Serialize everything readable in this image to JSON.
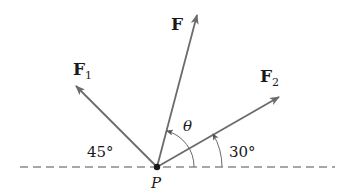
{
  "diagram": {
    "type": "force-vector-diagram",
    "point": {
      "label": "P"
    },
    "vectors": [
      {
        "name": "F1",
        "label": "F",
        "subscript": "1",
        "angle_from_horizontal": "45°",
        "side": "left"
      },
      {
        "name": "F",
        "label": "F",
        "subscript": "",
        "angle_label": "θ"
      },
      {
        "name": "F2",
        "label": "F",
        "subscript": "2",
        "angle_from_horizontal": "30°",
        "side": "right"
      }
    ],
    "angle_labels": {
      "f1_angle": "45°",
      "f2_angle": "30°",
      "theta": "θ"
    },
    "colors": {
      "vector": "#6b6b6b",
      "text": "#1a1a1a",
      "baseline": "#8a8a8a"
    }
  }
}
